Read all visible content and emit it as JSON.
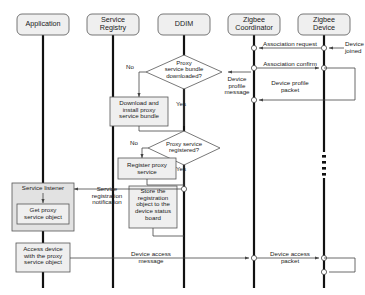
{
  "diagram": {
    "type": "uml-sequence-diagram",
    "title": "",
    "width": 365,
    "height": 295,
    "colors": {
      "lifeline": "#111111",
      "box_fill": "#efefef",
      "box_stroke": "#555555",
      "arrow": "#444444",
      "text": "#1a1a1a",
      "background": "#ffffff"
    }
  },
  "lifelines": [
    {
      "id": "application",
      "label": "Application",
      "x": 43
    },
    {
      "id": "service-registry",
      "label": "Service\nRegistry",
      "x": 113
    },
    {
      "id": "ddim",
      "label": "DDIM",
      "x": 184
    },
    {
      "id": "zigbee-coordinator",
      "label": "Zigbee\nCoordinator",
      "x": 254
    },
    {
      "id": "zigbee-device",
      "label": "Zigbee\nDevice",
      "x": 324
    }
  ],
  "messages": [
    {
      "id": "association-request",
      "label": "Association request",
      "from": "zigbee-device",
      "to": "zigbee-coordinator",
      "y": 52
    },
    {
      "id": "device-joined",
      "label": "Device\njoined",
      "note": true,
      "y": 50
    },
    {
      "id": "association-confirm",
      "label": "Association confirm",
      "from": "zigbee-coordinator",
      "to": "zigbee-device",
      "y": 72
    },
    {
      "id": "device-profile-packet",
      "label": "Device profile\npacket",
      "from": "zigbee-device",
      "to": "zigbee-coordinator",
      "y": 82
    },
    {
      "id": "device-profile-message",
      "label": "Device\nprofile\nmessage",
      "from": "zigbee-coordinator",
      "to": "ddim",
      "y": 82
    },
    {
      "id": "service-registration-notification",
      "label": "Service\nregistration\nnotification",
      "from": "ddim",
      "to": "application",
      "y": 190
    },
    {
      "id": "device-access-message",
      "label": "Device access\nmessage",
      "from": "application",
      "to": "zigbee-coordinator",
      "y": 252
    },
    {
      "id": "device-access-packet",
      "label": "Device access\npacket",
      "from": "zigbee-coordinator",
      "to": "zigbee-device",
      "y": 252
    }
  ],
  "decisions": [
    {
      "id": "proxy-bundle-downloaded",
      "label": "Proxy\nservice bundle\ndownloaded?",
      "no_label": "No",
      "yes_label": "Yes"
    },
    {
      "id": "proxy-service-registered",
      "label": "Proxy service\nregistered?",
      "no_label": "No",
      "yes_label": "Yes"
    }
  ],
  "activities": [
    {
      "id": "download-install-proxy-bundle",
      "label": "Download and\ninstall proxy\nservice bundle"
    },
    {
      "id": "register-proxy-service",
      "label": "Register proxy\nservice"
    },
    {
      "id": "store-registration-object",
      "label": "Store the\nregistration\nobject to the\ndevice status\nboard"
    },
    {
      "id": "service-listener",
      "label": "Service listener"
    },
    {
      "id": "get-proxy-service-object",
      "label": "Get proxy\nservice object"
    },
    {
      "id": "access-device-proxy-object",
      "label": "Access device\nwith the proxy\nservice object"
    }
  ]
}
